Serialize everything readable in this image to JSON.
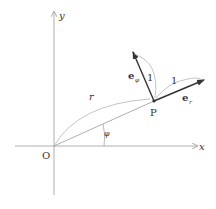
{
  "diagram": {
    "type": "polar-coordinates-unit-vectors",
    "axes": {
      "x_label": "x",
      "y_label": "y",
      "origin_label": "O"
    },
    "point": {
      "label": "P"
    },
    "radius_label": "r",
    "angle_label": "φ",
    "vectors": [
      {
        "name": "e_r",
        "base": "e",
        "subscript": "r",
        "length_label": "1"
      },
      {
        "name": "e_phi",
        "base": "e",
        "subscript": "φ",
        "length_label": "1"
      }
    ],
    "colors": {
      "axis": "#999999",
      "vector": "#333333",
      "text": "#333333"
    }
  }
}
